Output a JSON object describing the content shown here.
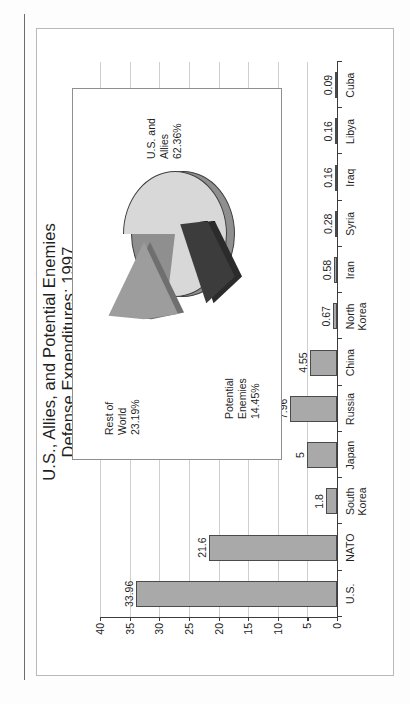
{
  "figure": {
    "caption": "Figure 2.2"
  },
  "chart_data": {
    "type": "bar",
    "title": "U.S., Allies, and Potential Enemies\nDefense Expenditures: 1997",
    "title_line1": "U.S., Allies, and Potential Enemies",
    "title_line2": "Defense Expenditures: 1997",
    "subtitle": "(% of world defense expenditures)",
    "xlabel": "",
    "ylabel": "",
    "ylim": [
      0,
      40
    ],
    "yticks": [
      0,
      5,
      10,
      15,
      20,
      25,
      30,
      35,
      40
    ],
    "grid": true,
    "legend": "none",
    "categories": [
      "U.S.",
      "NATO",
      "South\nKorea",
      "Japan",
      "Russia",
      "China",
      "North\nKorea",
      "Iran",
      "Syria",
      "Iraq",
      "Libya",
      "Cuba"
    ],
    "values": [
      33.96,
      21.6,
      1.8,
      5,
      7.96,
      4.55,
      0.67,
      0.58,
      0.28,
      0.16,
      0.16,
      0.09
    ],
    "value_labels": [
      "33.96",
      "21.6",
      "1.8",
      "5",
      "7.96",
      "4.55",
      "0.67",
      "0.58",
      "0.28",
      "0.16",
      "0.16",
      "0.09"
    ],
    "bar_color": "#a9a9a9",
    "bar_border_color": "#4a4a4a"
  },
  "inset_pie": {
    "type": "pie",
    "slices": [
      {
        "label": "U.S. and\nAllies",
        "value": 62.36,
        "value_label": "62.36%",
        "color": "#d8d8d8"
      },
      {
        "label": "Rest of\nWorld",
        "value": 23.19,
        "value_label": "23.19%",
        "color": "#9d9d9d"
      },
      {
        "label": "Potential\nEnemies",
        "value": 14.45,
        "value_label": "14.45%",
        "color": "#3c3c3c"
      }
    ],
    "labels": {
      "allies": "U.S. and\nAllies\n62.36%",
      "rest": "Rest of\nWorld\n23.19%",
      "enemies": "Potential\nEnemies\n14.45%"
    }
  }
}
